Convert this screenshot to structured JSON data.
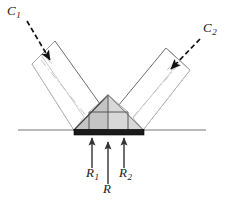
{
  "figure": {
    "background_color": "#ffffff",
    "width": 232,
    "height": 203
  },
  "labels": {
    "c1": {
      "text": "C",
      "sub": "1"
    },
    "c2": {
      "text": "C",
      "sub": "2"
    },
    "r1": {
      "text": "R",
      "sub": "1"
    },
    "r2": {
      "text": "R",
      "sub": "2"
    },
    "r": {
      "text": "R",
      "sub": ""
    }
  },
  "colors": {
    "outline": "#3c3c3c",
    "outline_light": "#b4b4b4",
    "gusset_fill": "#c4c4c4",
    "gusset_fill_light": "#dcdcdc",
    "base_plate": "#1a1a1a",
    "ground_line": "#555555",
    "arrow_dashed": "#111111",
    "arrow_solid": "#333333",
    "centerline": "#c0c0c0"
  },
  "geometry": {
    "ground_line": {
      "x1": 18,
      "y": 130,
      "x2": 206
    },
    "base_plate": {
      "x": 74,
      "y": 129,
      "width": 70,
      "height": 6
    },
    "apex": {
      "x": 108,
      "y": 95
    },
    "gusset_left_base": {
      "x": 74,
      "y": 130
    },
    "gusset_right_base": {
      "x": 143,
      "y": 130
    },
    "left_member": {
      "label": "C1",
      "angle_deg": -45,
      "near_corner": {
        "x": 74,
        "y": 130
      },
      "far_corner": {
        "x": 32,
        "y": 64
      }
    },
    "right_member": {
      "label": "C2",
      "angle_deg": 45,
      "near_corner": {
        "x": 143,
        "y": 130
      },
      "far_corner": {
        "x": 190,
        "y": 70
      }
    },
    "load_arrows": [
      {
        "name": "R1",
        "x": 92,
        "tail_y": 168,
        "head_y": 136
      },
      {
        "name": "R",
        "x": 108,
        "tail_y": 184,
        "head_y": 140
      },
      {
        "name": "R2",
        "x": 124,
        "tail_y": 168,
        "head_y": 136
      }
    ],
    "pointer_arrows": [
      {
        "name": "C1",
        "tail": {
          "x": 27,
          "y": 22
        },
        "head": {
          "x": 51,
          "y": 62
        }
      },
      {
        "name": "C2",
        "tail": {
          "x": 199,
          "y": 38
        },
        "head": {
          "x": 170,
          "y": 70
        }
      }
    ]
  }
}
